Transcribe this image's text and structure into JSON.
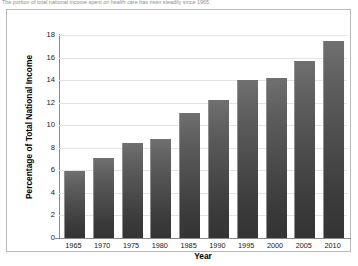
{
  "caption": "The portion of total national income spent on health care has risen steadily since 1965.",
  "chart_data": {
    "type": "bar",
    "title": "",
    "xlabel": "Year",
    "ylabel": "Percentage of Total National Income",
    "categories": [
      "1965",
      "1970",
      "1975",
      "1980",
      "1985",
      "1990",
      "1995",
      "2000",
      "2005",
      "2010"
    ],
    "values": [
      5.9,
      7.1,
      8.4,
      8.8,
      11.1,
      12.2,
      14.0,
      14.2,
      15.7,
      17.5
    ],
    "ylim": [
      0,
      18
    ],
    "yticks": [
      "0",
      "2",
      "4",
      "6",
      "8",
      "10",
      "12",
      "14",
      "16",
      "18"
    ],
    "ytick_values": [
      0,
      2,
      4,
      6,
      8,
      10,
      12,
      14,
      16,
      18
    ],
    "grid": true,
    "legend": "none",
    "bar_color_top": "#707070",
    "bar_color_bottom": "#343434",
    "gridline_color": "#e2e2e2",
    "axis_color": "#8a8a8a"
  }
}
